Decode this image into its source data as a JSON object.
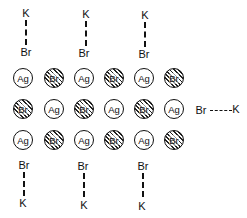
{
  "diagram": {
    "lattice": {
      "rows": [
        [
          "Ag",
          "Br",
          "Ag",
          "Br",
          "Ag",
          "Br"
        ],
        [
          "Br",
          "Ag",
          "Br",
          "Ag",
          "Br",
          "Ag"
        ],
        [
          "Ag",
          "Br",
          "Ag",
          "Br",
          "Ag",
          "Br"
        ]
      ],
      "legend": {
        "Ag": "plain circle",
        "Br": "hatched circle"
      }
    },
    "top_pairs": [
      {
        "outer": "K",
        "inner": "Br"
      },
      {
        "outer": "K",
        "inner": "Br"
      },
      {
        "outer": "K",
        "inner": "Br"
      }
    ],
    "bottom_pairs": [
      {
        "inner": "Br",
        "outer": "K"
      },
      {
        "inner": "Br",
        "outer": "K"
      },
      {
        "inner": "Br",
        "outer": "K"
      }
    ],
    "side_pair": {
      "inner": "Br",
      "outer": "K"
    }
  }
}
